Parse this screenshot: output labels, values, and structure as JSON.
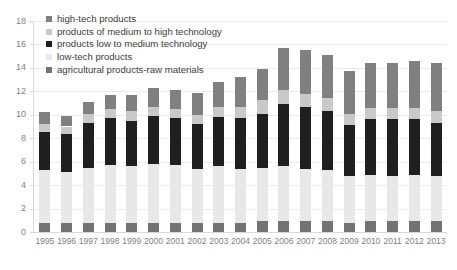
{
  "chart_data": {
    "type": "bar",
    "stacked": true,
    "title": "",
    "subtitle": "",
    "xlabel": "",
    "ylabel": "",
    "ylim": [
      0,
      18
    ],
    "ytick_step": 2,
    "yticks": [
      0,
      2,
      4,
      6,
      8,
      10,
      12,
      14,
      16,
      18
    ],
    "grid": true,
    "grid_axis": "y",
    "legend_position": "top-left",
    "categories": [
      "1995",
      "1996",
      "1997",
      "1998",
      "1999",
      "2000",
      "2001",
      "2002",
      "2003",
      "2004",
      "2005",
      "2006",
      "2007",
      "2008",
      "2009",
      "2010",
      "2011",
      "2012",
      "2013"
    ],
    "series": [
      {
        "name": "agricultural products-raw materials",
        "color": "#737373",
        "values": [
          0.8,
          0.8,
          0.8,
          0.8,
          0.8,
          0.8,
          0.8,
          0.8,
          0.8,
          0.8,
          0.9,
          0.9,
          0.9,
          0.9,
          0.8,
          0.9,
          0.9,
          0.9,
          0.9
        ]
      },
      {
        "name": "low-tech products",
        "color": "#e8e8e8",
        "values": [
          4.5,
          4.3,
          4.7,
          4.9,
          4.8,
          5.0,
          4.9,
          4.6,
          4.8,
          4.6,
          4.6,
          4.7,
          4.5,
          4.4,
          4.0,
          4.0,
          3.9,
          4.0,
          3.9
        ]
      },
      {
        "name": "products low to medium technology",
        "color": "#1f1f1f",
        "values": [
          3.2,
          3.3,
          3.8,
          4.0,
          3.9,
          4.1,
          4.0,
          3.8,
          4.2,
          4.3,
          4.6,
          5.3,
          5.3,
          5.0,
          4.3,
          4.7,
          4.8,
          4.7,
          4.5
        ]
      },
      {
        "name": "products of medium to high technology",
        "color": "#c9c9c9",
        "values": [
          0.7,
          0.6,
          0.8,
          0.8,
          0.8,
          0.8,
          0.8,
          0.8,
          0.9,
          1.0,
          1.2,
          1.2,
          1.1,
          1.1,
          1.0,
          1.0,
          1.0,
          1.0,
          1.0
        ]
      },
      {
        "name": "high-tech products",
        "color": "#808080",
        "values": [
          1.0,
          0.9,
          1.0,
          1.2,
          1.4,
          1.6,
          1.6,
          1.9,
          2.1,
          2.5,
          2.6,
          3.6,
          3.7,
          3.7,
          3.6,
          3.8,
          3.8,
          4.0,
          4.1
        ]
      }
    ],
    "totals": [
      10.2,
      9.9,
      11.1,
      11.7,
      11.7,
      12.3,
      12.1,
      11.9,
      12.8,
      13.2,
      13.9,
      15.7,
      15.5,
      15.1,
      13.7,
      14.4,
      14.4,
      14.6,
      14.4
    ]
  },
  "legend": {
    "items": [
      {
        "label": "high-tech products",
        "color": "#808080"
      },
      {
        "label": "products of medium to high technology",
        "color": "#c9c9c9"
      },
      {
        "label": "products low to medium technology",
        "color": "#1f1f1f"
      },
      {
        "label": "low-tech products",
        "color": "#e8e8e8"
      },
      {
        "label": "agricultural products-raw materials",
        "color": "#737373"
      }
    ]
  },
  "axes": {
    "y_tick_labels": [
      "0",
      "2",
      "4",
      "6",
      "8",
      "10",
      "12",
      "14",
      "16",
      "18"
    ],
    "x_tick_labels": [
      "1995",
      "1996",
      "1997",
      "1998",
      "1999",
      "2000",
      "2001",
      "2002",
      "2003",
      "2004",
      "2005",
      "2006",
      "2007",
      "2008",
      "2009",
      "2010",
      "2011",
      "2012",
      "2013"
    ]
  }
}
